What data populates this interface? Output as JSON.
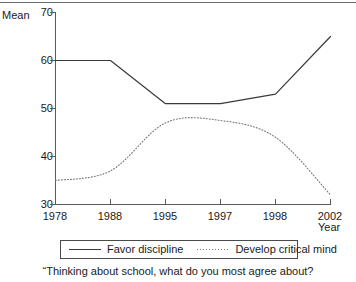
{
  "chart_data": {
    "type": "line",
    "title": "",
    "subtitle": "",
    "xlabel": "Year",
    "ylabel": "Mean",
    "categories": [
      "1978",
      "1988",
      "1995",
      "1997",
      "1998",
      "2002"
    ],
    "ylim": [
      30,
      70
    ],
    "yticks": [
      30,
      40,
      50,
      60,
      70
    ],
    "ytick_labels": [
      "30",
      "40",
      "50",
      "60",
      "70"
    ],
    "grid": false,
    "legend_position": "bottom",
    "series": [
      {
        "name": "Favor discipline",
        "style": "solid",
        "color": "#3a3a3a",
        "values": [
          60,
          60,
          51,
          51,
          53,
          65
        ]
      },
      {
        "name": "Develop critical mind",
        "style": "dotted",
        "color": "#7a7a7a",
        "values": [
          35,
          37,
          47,
          47.5,
          44,
          32
        ]
      }
    ],
    "caption": "“Thinking about school, what do you most agree about?"
  },
  "axes": {
    "y_title": "Mean",
    "x_title": "Year",
    "y_tick_0": "70",
    "y_tick_1": "60",
    "y_tick_2": "50",
    "y_tick_3": "40",
    "y_tick_4": "30",
    "x_tick_0": "1978",
    "x_tick_1": "1988",
    "x_tick_2": "1995",
    "x_tick_3": "1997",
    "x_tick_4": "1998",
    "x_tick_5": "2002"
  },
  "legend": {
    "entry_0_label": "Favor discipline",
    "entry_1_label": "Develop critical mind"
  },
  "caption": {
    "text": "“Thinking about school, what do you most agree about?"
  }
}
